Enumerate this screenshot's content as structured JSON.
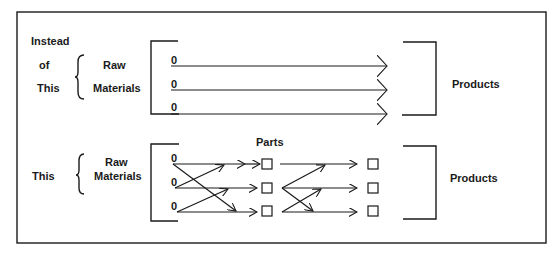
{
  "top_section": {
    "label_lines": [
      "Instead",
      "of",
      "This"
    ],
    "input_label_lines": [
      "Raw",
      "Materials"
    ],
    "inputs": [
      "0",
      "0",
      "0"
    ],
    "output_label": "Products"
  },
  "bottom_section": {
    "label": "This",
    "input_label_lines": [
      "Raw",
      "Materials"
    ],
    "inputs": [
      "0",
      "0",
      "0"
    ],
    "intermediate_label": "Parts",
    "output_label": "Products"
  },
  "colors": {
    "ink": "#1a1a1a",
    "background": "#ffffff"
  }
}
